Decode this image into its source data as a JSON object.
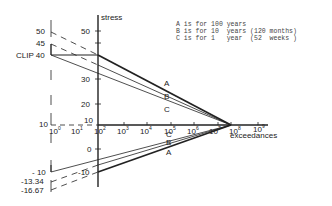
{
  "diagram": {
    "y_axis_label": "stress",
    "x_axis_label": "exceedances",
    "y_ticks_main": [
      "50",
      "30",
      "20",
      "10",
      "0",
      "-10"
    ],
    "y_ticks_left": [
      "50",
      "45",
      "CLIP 40",
      "10",
      "- 10",
      "-13.34",
      "-16.67"
    ],
    "x_ticks": [
      {
        "base": "10",
        "exp": "0"
      },
      {
        "base": "10",
        "exp": "1"
      },
      {
        "base": "10",
        "exp": "2"
      },
      {
        "base": "10",
        "exp": "3"
      },
      {
        "base": "10",
        "exp": "4"
      },
      {
        "base": "10",
        "exp": "5"
      },
      {
        "base": "10",
        "exp": "6"
      },
      {
        "base": "10",
        "exp": "7"
      },
      {
        "base": "10",
        "exp": "8"
      },
      {
        "base": "10",
        "exp": "9"
      }
    ],
    "line_labels_upper": [
      "A",
      "B",
      "C"
    ],
    "line_labels_lower": [
      "C",
      "B",
      "A"
    ],
    "legend": [
      "A is for 100 years",
      "B is for 10  years (120 months)",
      "C is for 1   year  (52  weeks )"
    ]
  }
}
